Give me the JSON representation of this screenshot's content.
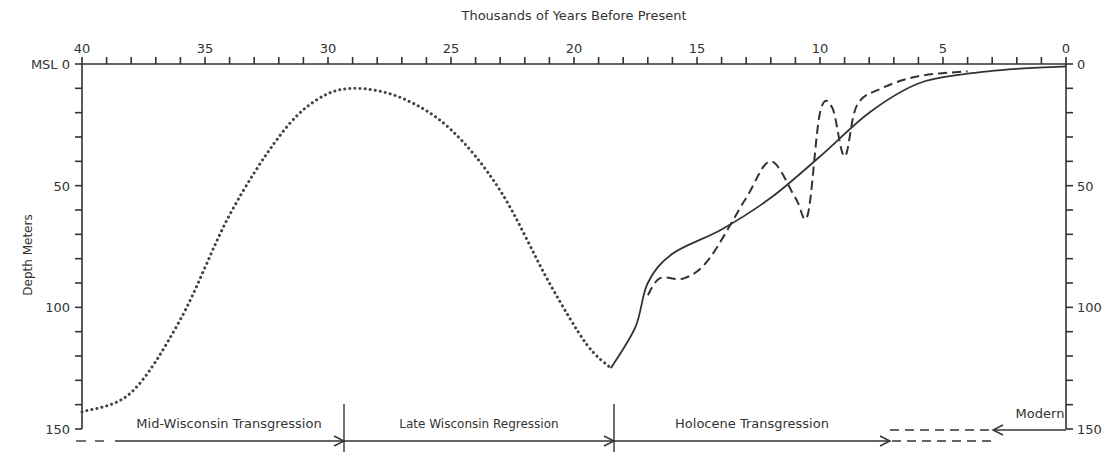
{
  "chart_data": {
    "type": "line",
    "title": "",
    "top_axis_label": "Thousands of Years Before Present",
    "xlabel": "Thousands of Years Before Present",
    "ylabel": "Depth Meters",
    "x_ticks": [
      "40",
      "35",
      "30",
      "25",
      "20",
      "15",
      "10",
      "5",
      "0"
    ],
    "x_range": [
      40,
      0
    ],
    "y_ticks_left": [
      "MSL 0",
      "50",
      "100",
      "150"
    ],
    "y_ticks_right": [
      "0",
      "50",
      "100",
      "150"
    ],
    "y_range": [
      0,
      150
    ],
    "grid": false,
    "series": [
      {
        "name": "Estimated sea level (dotted)",
        "style": "dotted",
        "x": [
          40,
          38,
          36,
          34,
          32,
          30.5,
          29,
          27,
          25,
          23,
          21,
          19.5,
          18.5
        ],
        "y": [
          143,
          135,
          105,
          62,
          30,
          15,
          10,
          14,
          27,
          52,
          90,
          115,
          125
        ]
      },
      {
        "name": "Smoothed sea level curve (solid)",
        "style": "solid",
        "x": [
          18.5,
          17.5,
          17,
          16,
          14,
          12,
          10,
          8,
          6,
          4,
          2,
          0
        ],
        "y": [
          125,
          108,
          90,
          78,
          68,
          55,
          38,
          20,
          8,
          4,
          2,
          1
        ]
      },
      {
        "name": "Fluctuating sea level curve (dashed)",
        "style": "dashed",
        "x": [
          17,
          16.5,
          15.5,
          14.5,
          13,
          12,
          11,
          10.5,
          10,
          9.5,
          9,
          8.5,
          7.5,
          6,
          4
        ],
        "y": [
          95,
          88,
          88,
          80,
          55,
          40,
          55,
          62,
          20,
          18,
          38,
          17,
          10,
          5,
          3
        ]
      }
    ],
    "period_annotations": [
      {
        "label": "Mid-Wisconsin Transgression",
        "from": 40,
        "to": 29.3
      },
      {
        "label": "Late Wisconsin Regression",
        "from": 29.3,
        "to": 18.5
      },
      {
        "label": "Holocene Transgression",
        "from": 18.5,
        "to": 7.2
      },
      {
        "label": "Modern",
        "from": 0,
        "to": 3
      }
    ]
  }
}
